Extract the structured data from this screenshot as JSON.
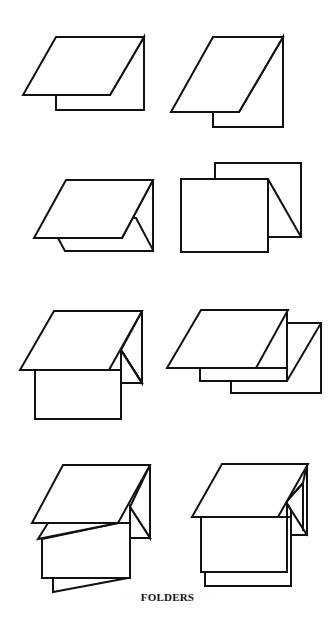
{
  "figure": {
    "caption": "FOLDERS",
    "background": "#ffffff",
    "line_color": "#111111",
    "layout": {
      "rows": 4,
      "columns": 2
    },
    "items": [
      {
        "index": 1,
        "name": "single-fold-short-back",
        "description": "Simple folder: front panel folded over, shorter back panel visible"
      },
      {
        "index": 2,
        "name": "single-fold-tall",
        "description": "Simple folder with taller slanted front panel"
      },
      {
        "index": 3,
        "name": "folder-with-inner-gusset",
        "description": "Folder with gusset fold on right side"
      },
      {
        "index": 4,
        "name": "open-rectangular-folder",
        "description": "Upright folded rectangles with diagonal fold"
      },
      {
        "index": 5,
        "name": "folder-with-hanging-panel",
        "description": "Folded cover with lower panel hanging beneath"
      },
      {
        "index": 6,
        "name": "double-stepped-folder",
        "description": "Folder with two stepped back panels"
      },
      {
        "index": 7,
        "name": "multi-panel-accordion-folder",
        "description": "Accordion folder with several slanted panels"
      },
      {
        "index": 8,
        "name": "zigzag-gusset-folder",
        "description": "Folder with zigzag gusset and two stacked panels"
      }
    ]
  }
}
